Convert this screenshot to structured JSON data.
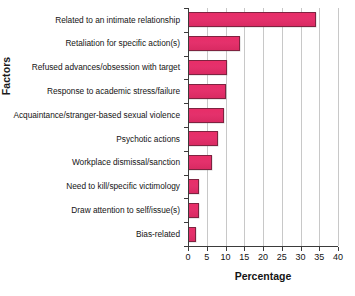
{
  "chart_data": {
    "type": "bar",
    "orientation": "horizontal",
    "title": "",
    "xlabel": "Percentage",
    "ylabel": "Factors",
    "xlim": [
      0,
      40
    ],
    "xticks": [
      0,
      5,
      10,
      15,
      20,
      25,
      30,
      35,
      40
    ],
    "grid": true,
    "legend": false,
    "bar_color": "#e8336b",
    "bar_edge_color": "#7e2340",
    "categories": [
      "Related to an intimate relationship",
      "Retaliation for specific action(s)",
      "Refused advances/obsession with target",
      "Response to academic stress/failure",
      "Acquaintance/stranger-based sexual violence",
      "Psychotic actions",
      "Workplace dismissal/sanction",
      "Need to kill/specific victimology",
      "Draw attention to self/issue(s)",
      "Bias-related"
    ],
    "values": [
      34,
      13.8,
      10.3,
      10.1,
      9.6,
      8,
      6.3,
      3,
      2.9,
      2.2
    ]
  }
}
